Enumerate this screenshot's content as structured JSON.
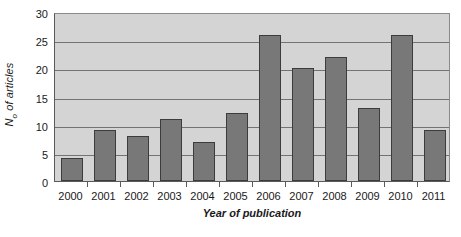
{
  "chart_data": {
    "type": "bar",
    "title": "",
    "subtitle": "",
    "xlabel": "Year of publication",
    "ylabel": "N₀ of articles",
    "ylabel_main": "N",
    "ylabel_sub": "o",
    "ylabel_rest": " of articles",
    "categories": [
      "2000",
      "2001",
      "2002",
      "2003",
      "2004",
      "2005",
      "2006",
      "2007",
      "2008",
      "2009",
      "2010",
      "2011"
    ],
    "values": [
      4,
      9,
      8,
      11,
      7,
      12,
      26,
      20,
      22,
      13,
      26,
      9
    ],
    "ylim": [
      0,
      30
    ],
    "yticks": [
      0,
      5,
      10,
      15,
      20,
      25,
      30
    ],
    "ytick_labels": [
      "0",
      "5",
      "10",
      "15",
      "20",
      "25",
      "30"
    ],
    "grid": "horizontal",
    "legend": "none",
    "series": [
      {
        "name": "No of articles",
        "values": [
          4,
          9,
          8,
          11,
          7,
          12,
          26,
          20,
          22,
          13,
          26,
          9
        ]
      }
    ],
    "colors": {
      "bar_fill": "#787878",
      "bar_border": "#3c3c3c",
      "plot_background": "#d4d4d4",
      "gridline": "#737373",
      "axis": "#5a5a5a",
      "text": "#1a1a1a",
      "figure_background": "#ffffff"
    }
  }
}
